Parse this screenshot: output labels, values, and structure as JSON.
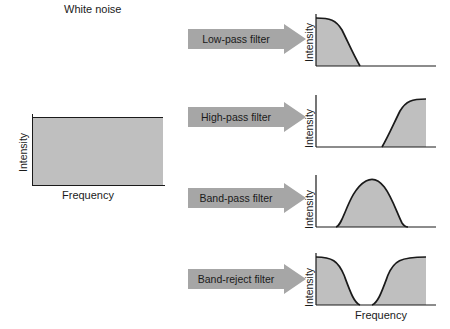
{
  "diagram": {
    "fill_color": "#bfbfbf",
    "arrow_color": "#a6a6a6",
    "line_color": "#1a1a1a"
  },
  "source": {
    "title": "White noise",
    "y_axis_label": "Intensity",
    "x_axis_label": "Frequency"
  },
  "filters": [
    {
      "id": "low-pass",
      "arrow_label": "Low-pass filter",
      "y_axis_label": "Intensity"
    },
    {
      "id": "high-pass",
      "arrow_label": "High-pass filter",
      "y_axis_label": "Intensity"
    },
    {
      "id": "band-pass",
      "arrow_label": "Band-pass filter",
      "y_axis_label": "Intensity"
    },
    {
      "id": "band-reject",
      "arrow_label": "Band-reject filter",
      "y_axis_label": "Intensity"
    }
  ],
  "output_axis": {
    "x_axis_label": "Frequency"
  }
}
